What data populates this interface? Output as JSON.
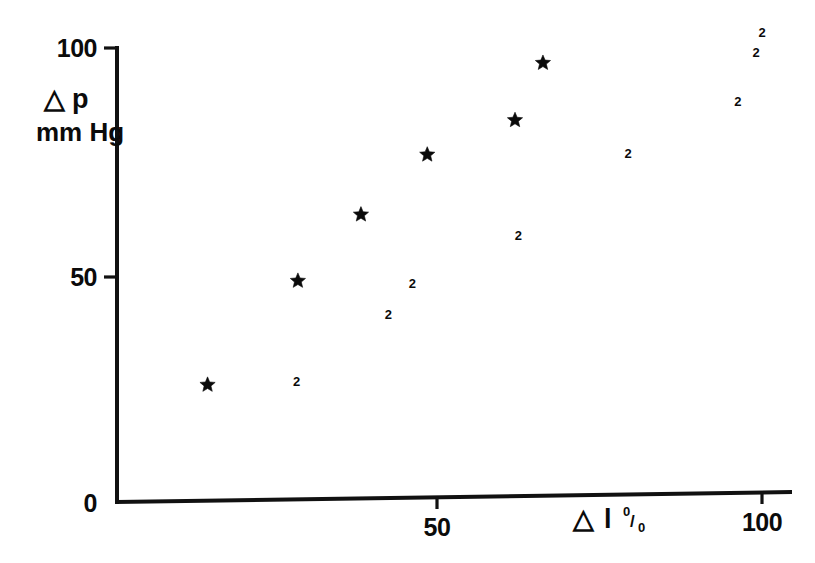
{
  "chart_data": {
    "type": "scatter",
    "title": "",
    "xlabel": "Δ l %",
    "ylabel": "Δ p mm Hg",
    "xlim": [
      0,
      105
    ],
    "ylim": [
      0,
      108
    ],
    "xticks": [
      50,
      100
    ],
    "yticks": [
      0,
      50,
      100
    ],
    "xtick_labels": [
      "50",
      "100"
    ],
    "ytick_labels": [
      "0",
      "50",
      "100"
    ],
    "grid": false,
    "legend": false,
    "marker_note": "markers drawn as filled stars for single observations and as the digit 2 where two observations coincide",
    "points": [
      {
        "x": 14.7,
        "y": 25.8,
        "marker": "star",
        "count": 1
      },
      {
        "x": 28.4,
        "y": 26.5,
        "marker": "2",
        "count": 2
      },
      {
        "x": 28.6,
        "y": 48.7,
        "marker": "star",
        "count": 1
      },
      {
        "x": 38.3,
        "y": 63.3,
        "marker": "star",
        "count": 1
      },
      {
        "x": 42.5,
        "y": 41.4,
        "marker": "2",
        "count": 2
      },
      {
        "x": 46.2,
        "y": 48.2,
        "marker": "2",
        "count": 2
      },
      {
        "x": 48.5,
        "y": 76.5,
        "marker": "star",
        "count": 1
      },
      {
        "x": 62.0,
        "y": 84.1,
        "marker": "star",
        "count": 1
      },
      {
        "x": 62.5,
        "y": 58.6,
        "marker": "2",
        "count": 2
      },
      {
        "x": 66.3,
        "y": 96.7,
        "marker": "star",
        "count": 1
      },
      {
        "x": 79.4,
        "y": 76.7,
        "marker": "2",
        "count": 2
      },
      {
        "x": 96.3,
        "y": 88.2,
        "marker": "2",
        "count": 2
      },
      {
        "x": 99.1,
        "y": 99.0,
        "marker": "2",
        "count": 2
      },
      {
        "x": 100.0,
        "y": 103.4,
        "marker": "2",
        "count": 2
      }
    ]
  },
  "axes": {
    "y_axis": {
      "tick_100": "100",
      "tick_50": "50",
      "tick_0": "0",
      "title_delta": "△",
      "title_p": "p",
      "title_units": "mm  Hg"
    },
    "x_axis": {
      "tick_50": "50",
      "tick_100": "100",
      "title_delta": "△",
      "title_l": "l",
      "title_pct_numerator": "0",
      "title_pct_slash": "/",
      "title_pct_denominator": "0"
    }
  },
  "colors": {
    "ink": "#0b0b0b",
    "background": "#ffffff",
    "marker": "#0a0a0a"
  }
}
